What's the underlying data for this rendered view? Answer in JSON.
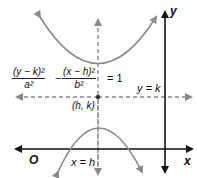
{
  "diagram": {
    "equation": {
      "term1_numerator": "(y − k)²",
      "term1_denominator": "a²",
      "minus": "−",
      "term2_numerator": "(x − h)²",
      "term2_denominator": "b²",
      "equals": "= 1"
    },
    "labels": {
      "y_axis": "y",
      "x_axis": "x",
      "origin": "O",
      "center": "(h, k)",
      "horizontal_line": "y = k",
      "vertical_line": "x = h"
    },
    "colors": {
      "axis": "#111111",
      "curve": "#8a8a8a",
      "dashed": "#8a8a8a",
      "text": "#111111"
    }
  }
}
